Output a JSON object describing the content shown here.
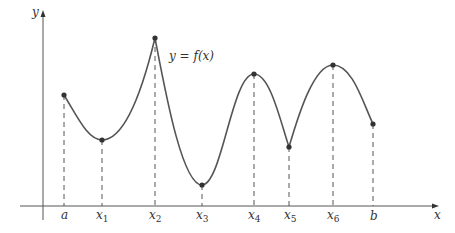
{
  "diagram": {
    "type": "function-graph",
    "axes": {
      "x_label": "x",
      "y_label": "y"
    },
    "curve_label": "y = f(x)",
    "points": [
      {
        "name": "a",
        "px": 64,
        "py": 95,
        "kind": "endpoint"
      },
      {
        "name": "x1",
        "px": 102,
        "py": 140,
        "kind": "local-min"
      },
      {
        "name": "x2",
        "px": 155,
        "py": 38,
        "kind": "local-max"
      },
      {
        "name": "x3",
        "px": 202,
        "py": 185,
        "kind": "local-min"
      },
      {
        "name": "x4",
        "px": 254,
        "py": 74,
        "kind": "local-max"
      },
      {
        "name": "x5",
        "px": 289,
        "py": 147,
        "kind": "local-min"
      },
      {
        "name": "x6",
        "px": 333,
        "py": 65,
        "kind": "local-max"
      },
      {
        "name": "b",
        "px": 373,
        "py": 124,
        "kind": "endpoint"
      }
    ],
    "tick_labels": [
      "a",
      "x1",
      "x2",
      "x3",
      "x4",
      "x5",
      "x6",
      "b"
    ]
  },
  "labels": {
    "y": "y",
    "x": "x",
    "curve": "y = f(x)",
    "a": "a",
    "b": "b",
    "x_base": "x",
    "subs": [
      "1",
      "2",
      "3",
      "4",
      "5",
      "6"
    ]
  }
}
